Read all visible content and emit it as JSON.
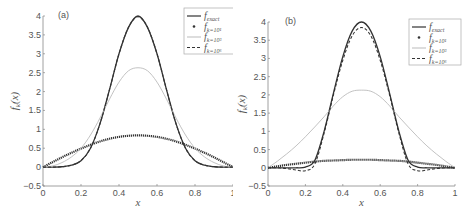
{
  "chart_data": [
    {
      "type": "line",
      "panel_label": "(a)",
      "xlabel": "x",
      "ylabel": "f_k(x)",
      "xlim": [
        0,
        1
      ],
      "ylim": [
        -0.5,
        4
      ],
      "xticks": [
        "0",
        "0.2",
        "0.4",
        "0.6",
        "0.8",
        "1"
      ],
      "yticks": [
        "-0.5",
        "0",
        "0.5",
        "1",
        "1.5",
        "2",
        "2.5",
        "3",
        "3.5",
        "4"
      ],
      "grid": false,
      "legend_position": "upper right",
      "x": [
        0,
        0.05,
        0.1,
        0.15,
        0.2,
        0.25,
        0.3,
        0.35,
        0.4,
        0.45,
        0.5,
        0.55,
        0.6,
        0.65,
        0.7,
        0.75,
        0.8,
        0.85,
        0.9,
        0.95,
        1
      ],
      "series": [
        {
          "name": "f_exact",
          "style": "solid",
          "values": [
            0,
            0,
            0.01,
            0.05,
            0.17,
            0.5,
            1.15,
            2.05,
            3.0,
            3.7,
            4.0,
            3.7,
            3.0,
            2.05,
            1.15,
            0.5,
            0.17,
            0.05,
            0.01,
            0,
            0
          ]
        },
        {
          "name": "f_{k=10^1}",
          "style": "dots",
          "values": [
            0,
            0.13,
            0.26,
            0.38,
            0.49,
            0.59,
            0.68,
            0.75,
            0.8,
            0.83,
            0.84,
            0.83,
            0.8,
            0.75,
            0.68,
            0.59,
            0.49,
            0.38,
            0.26,
            0.13,
            0
          ]
        },
        {
          "name": "f_{k=10^3}",
          "style": "light",
          "values": [
            0,
            0.03,
            0.12,
            0.27,
            0.5,
            0.85,
            1.3,
            1.8,
            2.25,
            2.55,
            2.63,
            2.55,
            2.25,
            1.8,
            1.3,
            0.85,
            0.5,
            0.27,
            0.12,
            0.03,
            0
          ]
        },
        {
          "name": "f_{k=10^6}",
          "style": "dashed",
          "values": [
            0,
            0,
            0.01,
            0.05,
            0.17,
            0.5,
            1.15,
            2.05,
            3.0,
            3.7,
            3.98,
            3.7,
            3.0,
            2.05,
            1.15,
            0.5,
            0.17,
            0.05,
            0.01,
            0,
            0
          ]
        }
      ]
    },
    {
      "type": "line",
      "panel_label": "(b)",
      "xlabel": "x",
      "ylabel": "f_k(x)",
      "xlim": [
        0,
        1
      ],
      "ylim": [
        -0.5,
        4
      ],
      "xticks": [
        "0",
        "0.2",
        "0.4",
        "0.6",
        "0.8",
        "1"
      ],
      "yticks": [
        "-0.5",
        "0",
        "0.5",
        "1",
        "1.5",
        "2",
        "2.5",
        "3",
        "3.5",
        "4"
      ],
      "grid": false,
      "legend_position": "upper right",
      "x": [
        0,
        0.05,
        0.1,
        0.15,
        0.2,
        0.25,
        0.3,
        0.35,
        0.4,
        0.45,
        0.5,
        0.55,
        0.6,
        0.65,
        0.7,
        0.75,
        0.8,
        0.85,
        0.9,
        0.95,
        1
      ],
      "series": [
        {
          "name": "f_exact",
          "style": "solid",
          "values": [
            0,
            0,
            0,
            0,
            0.02,
            0.2,
            1.0,
            2.05,
            3.05,
            3.75,
            4.0,
            3.75,
            3.05,
            2.05,
            1.0,
            0.2,
            0.02,
            0,
            0,
            0,
            0
          ]
        },
        {
          "name": "f_{k=10^1}",
          "style": "dots",
          "values": [
            0,
            0.04,
            0.08,
            0.11,
            0.14,
            0.17,
            0.19,
            0.2,
            0.21,
            0.22,
            0.22,
            0.22,
            0.21,
            0.2,
            0.19,
            0.17,
            0.14,
            0.11,
            0.08,
            0.04,
            0
          ]
        },
        {
          "name": "f_{k=10^3}",
          "style": "light",
          "values": [
            0,
            0.18,
            0.38,
            0.6,
            0.85,
            1.12,
            1.4,
            1.7,
            1.95,
            2.1,
            2.13,
            2.1,
            1.95,
            1.7,
            1.4,
            1.12,
            0.85,
            0.6,
            0.38,
            0.18,
            0
          ]
        },
        {
          "name": "f_{k=10^6}",
          "style": "dashed",
          "values": [
            0,
            0,
            -0.02,
            -0.06,
            -0.08,
            0.1,
            0.95,
            2.0,
            2.95,
            3.62,
            3.85,
            3.62,
            2.95,
            2.0,
            0.95,
            0.1,
            -0.08,
            -0.06,
            -0.02,
            0,
            0
          ]
        }
      ]
    }
  ],
  "legend": {
    "exact": "exact",
    "k1": "k=10¹",
    "k3": "k=10³",
    "k6": "k=10⁶",
    "f": "f"
  },
  "colors": {
    "axis": "#888888",
    "exact": "#333333",
    "k1": "#333333",
    "k3": "#bbbbbb",
    "k6": "#333333"
  }
}
